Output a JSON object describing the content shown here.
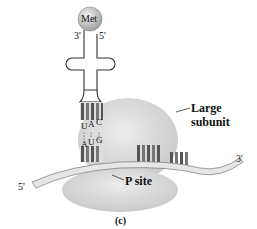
{
  "figure": {
    "panel_label": "(c)",
    "trna": {
      "amino_acid": "Met",
      "end_3": "3'",
      "end_5": "5'",
      "anticodon": [
        "U",
        "A",
        "C"
      ]
    },
    "mrna": {
      "codon": [
        "A",
        "U",
        "G"
      ],
      "end_5": "5'",
      "end_3": "3'"
    },
    "labels": {
      "large_subunit_line1": "Large",
      "large_subunit_line2": "subunit",
      "p_site": "P site"
    },
    "colors": {
      "subunit": "#d9d9d9",
      "met_ball": "#bdbdbd",
      "stripe_dark": "#6b6b6b",
      "text": "#111111"
    }
  }
}
